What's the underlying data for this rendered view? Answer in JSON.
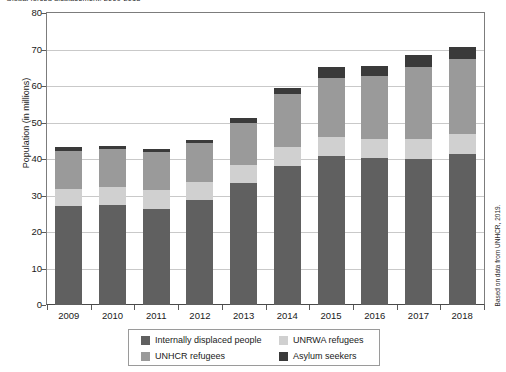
{
  "title": "Global forced displacement, 2009-2018",
  "source_note": "Based on data from UNHCR, 2019.",
  "axis": {
    "ylabel": "Population (in millions)",
    "xlabel": "",
    "yticks": [
      0,
      10,
      20,
      30,
      40,
      50,
      60,
      70,
      80
    ]
  },
  "legend": {
    "items": [
      {
        "label": "Internally displaced people",
        "color": "#606060"
      },
      {
        "label": "UNRWA refugees",
        "color": "#d0d0d0"
      },
      {
        "label": "UNHCR refugees",
        "color": "#9a9a9a"
      },
      {
        "label": "Asylum seekers",
        "color": "#3a3a3a"
      }
    ]
  },
  "chart_data": {
    "type": "bar",
    "stacked": true,
    "title": "Global forced displacement, 2009-2018",
    "xlabel": "",
    "ylabel": "Population (in millions)",
    "ylim": [
      0,
      80
    ],
    "ytick_step": 10,
    "grid": true,
    "legend_position": "bottom",
    "categories": [
      "2009",
      "2010",
      "2011",
      "2012",
      "2013",
      "2014",
      "2015",
      "2016",
      "2017",
      "2018"
    ],
    "series": [
      {
        "name": "Internally displaced people",
        "color": "#606060",
        "values": [
          27.1,
          27.5,
          26.4,
          28.8,
          33.3,
          38.2,
          40.8,
          40.3,
          40.0,
          41.4
        ]
      },
      {
        "name": "UNRWA refugees",
        "color": "#d0d0d0",
        "values": [
          4.8,
          4.8,
          5.0,
          5.0,
          5.0,
          5.1,
          5.2,
          5.3,
          5.4,
          5.5
        ]
      },
      {
        "name": "UNHCR refugees",
        "color": "#9a9a9a",
        "values": [
          10.4,
          10.5,
          10.4,
          10.5,
          11.7,
          14.4,
          16.1,
          17.2,
          19.9,
          20.4
        ]
      },
      {
        "name": "Asylum seekers",
        "color": "#3a3a3a",
        "values": [
          1.0,
          0.8,
          0.9,
          0.9,
          1.2,
          1.8,
          3.2,
          2.8,
          3.1,
          3.5
        ]
      }
    ],
    "totals": [
      43.3,
      43.6,
      42.7,
      45.2,
      51.2,
      59.5,
      65.3,
      65.6,
      68.4,
      70.8
    ]
  }
}
